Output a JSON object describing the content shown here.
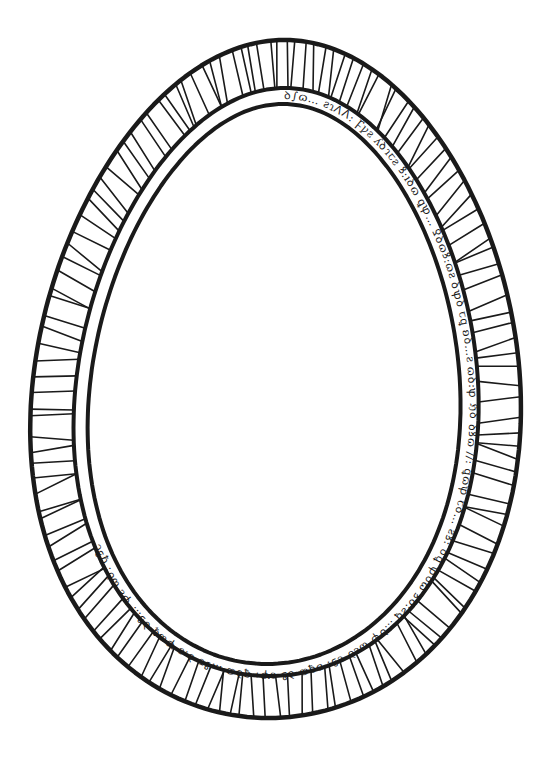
{
  "illustration": {
    "title": "Egg-shaped decorative frame",
    "description": "Hand-drawn ink egg-shaped border with radial hatched outer band and inner band of pseudo-script glyphs",
    "colors": {
      "ink": "#1a1a1a",
      "paper": "#ffffff"
    },
    "rings": {
      "outer": {
        "cx": 277,
        "top": 40,
        "bottom": 718,
        "left": 33,
        "right": 520
      },
      "middle": {
        "cx": 277,
        "top": 88,
        "bottom": 676,
        "left": 76,
        "right": 478
      },
      "inner": {
        "cx": 277,
        "top": 104,
        "bottom": 664,
        "left": 90,
        "right": 460
      }
    },
    "hatch_count": 140,
    "band_glyphs": "ꝺ∫ɷ… ƨɿⴷⴷ: Ꝼꝩƨ ʎꝺɿꞇƨ ꝸ:ıꝺɷ ꝗꝕ… Ꝿꝺɷꝸ:ɷƨ ꝺꝕꝺ ꞇꝗ ʚꝺ…ƨ ɷꝺ:ꝕ ℌꝺ ꝺꝸɷ //: ꝗɷꝕ ꞇꝺ… ƨꝸ: ꝺꝗ ꝕꝺɷ ꝸꝺ:ƨꝗ …ꝺꝕ ɷƨꝺ ꞇꝸ: ʚꝗɷ ꝺꝸ ƨꝕ: ꝗꝺɷ …ꝸꞇ ꝺ:ƨ ꝕɷꝗ ꝺꝸ… ꝕƨ ɷꝺ: ꝗꝸꞇ"
  }
}
